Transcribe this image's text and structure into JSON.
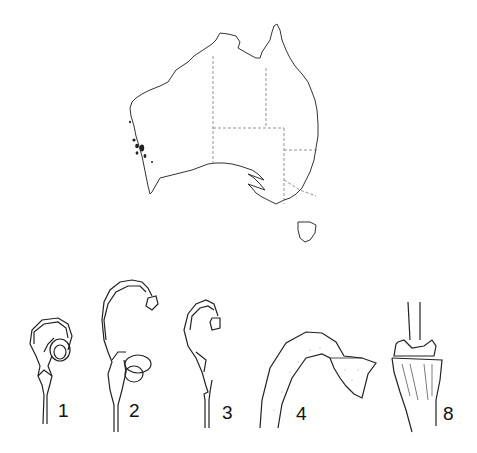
{
  "plate": {
    "type": "botanical-line-drawing",
    "map": {
      "region": "Australia",
      "state_borders": "dashed",
      "distribution_markers": "south-west Western Australia"
    },
    "figures": [
      {
        "id": "fig-1",
        "label": "1",
        "depicts": "flower with hooded curved style"
      },
      {
        "id": "fig-2",
        "label": "2",
        "depicts": "flower with long arching style"
      },
      {
        "id": "fig-3",
        "label": "3",
        "depicts": "pistil with arching style"
      },
      {
        "id": "fig-4",
        "label": "4",
        "depicts": "enlarged style end / pollen presenter"
      },
      {
        "id": "fig-8",
        "label": "8",
        "depicts": "enlarged base of stalk / node"
      }
    ]
  },
  "colors": {
    "ink": "#222222",
    "background": "#ffffff",
    "stipple": "#888888"
  }
}
